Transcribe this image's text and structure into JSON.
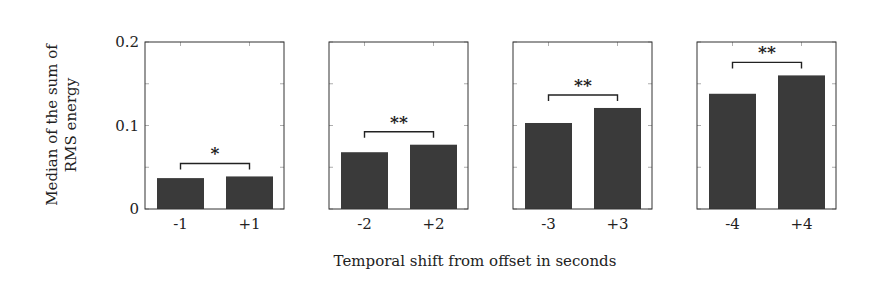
{
  "chart_data": {
    "type": "bar",
    "title": "",
    "ylabel": "Median of the sum of RMS energy",
    "ylabel_lines": [
      "Median of the sum of",
      "RMS energy"
    ],
    "xlabel": "Temporal shift from offset in seconds",
    "ylim": [
      0,
      0.2
    ],
    "yticks": [
      0,
      0.1,
      0.2
    ],
    "ytick_labels": [
      "0",
      "0.1",
      "0.2"
    ],
    "minor_yticks": [
      0.05,
      0.15
    ],
    "grid": false,
    "legend": null,
    "bar_color": "#3a3a3a",
    "panels": [
      {
        "categories": [
          "-1",
          "+1"
        ],
        "values": [
          0.037,
          0.039
        ],
        "significance": "*"
      },
      {
        "categories": [
          "-2",
          "+2"
        ],
        "values": [
          0.068,
          0.077
        ],
        "significance": "**"
      },
      {
        "categories": [
          "-3",
          "+3"
        ],
        "values": [
          0.103,
          0.121
        ],
        "significance": "**"
      },
      {
        "categories": [
          "-4",
          "+4"
        ],
        "values": [
          0.138,
          0.16
        ],
        "significance": "**"
      }
    ]
  },
  "layout": {
    "panel_lefts": [
      145,
      329,
      513,
      697
    ],
    "panel_width": 139,
    "plot_top": 42,
    "plot_bottom": 209,
    "bar_width": 47,
    "bar_offsets": [
      12,
      81
    ]
  }
}
